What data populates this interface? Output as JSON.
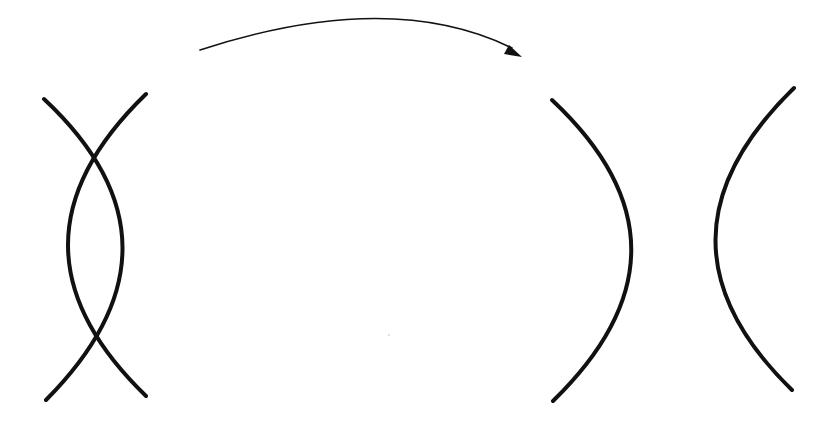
{
  "diagram": {
    "colors": {
      "background": "#ffffff",
      "stroke": "#111111"
    },
    "before_group": {
      "label": "intersecting-curves",
      "curves": [
        {
          "name": "curve-bulging-right",
          "d": "M 44 99 Q 200 245 46 400",
          "width": 4
        },
        {
          "name": "curve-bulging-left",
          "d": "M 146 94 Q -10 245 146 396",
          "width": 4
        }
      ]
    },
    "transition_arrow": {
      "d": "M 200 50 Q 390 -12 512 48",
      "width": 1.6,
      "head": "509,45 522,57 504,54"
    },
    "after_group": {
      "label": "separated-curves",
      "curves": [
        {
          "name": "right-parenthesis-curve",
          "d": "M 552 100 Q 710 248 553 401",
          "width": 4
        },
        {
          "name": "left-parenthesis-curve",
          "d": "M 794 88 Q 638 240 792 390",
          "width": 4
        }
      ]
    },
    "stray_dot": {
      "cx": 389,
      "cy": 335,
      "r": 0.8,
      "color": "#bbbbbb"
    }
  }
}
